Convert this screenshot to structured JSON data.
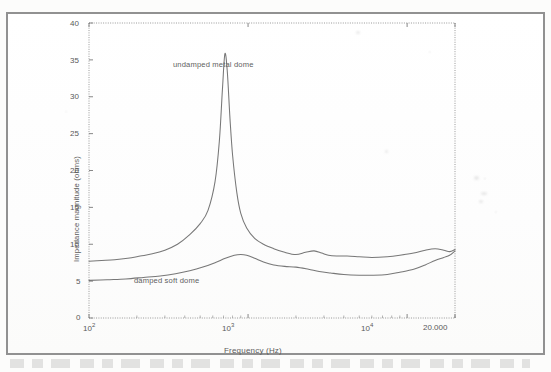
{
  "figure": {
    "background_color": "#ffffff",
    "frame_color": "#8e8e8e",
    "curve_color": "#6b6b6b",
    "axis_color": "#7a7a7a"
  },
  "axes": {
    "ylabel": "Impedance magnitude (ohms)",
    "xlabel": "Frequency (Hz)",
    "yticks": [
      "0",
      "5",
      "10",
      "15",
      "20",
      "25",
      "30",
      "35",
      "40"
    ],
    "xticks": [
      {
        "label": "10",
        "exp": "2"
      },
      {
        "label": "10",
        "exp": "3"
      },
      {
        "label": "10",
        "exp": "4"
      }
    ],
    "xend_label": "20.000"
  },
  "annotations": {
    "upper": "undamped metal dome",
    "lower": "damped soft dome"
  },
  "chart_data": {
    "type": "line",
    "title": "",
    "xlabel": "Frequency (Hz)",
    "ylabel": "Impedance magnitude (ohms)",
    "xscale": "log",
    "yscale": "linear",
    "xlim": [
      100,
      20000
    ],
    "ylim": [
      0,
      40
    ],
    "yticks": [
      0,
      5,
      10,
      15,
      20,
      25,
      30,
      35,
      40
    ],
    "xticks": [
      100,
      1000,
      10000,
      20000
    ],
    "xtick_labels": [
      "10^2",
      "10^3",
      "10^4",
      "20.000"
    ],
    "grid": false,
    "legend": "annotations-inline",
    "series": [
      {
        "name": "undamped metal dome",
        "annotation_x": 1700,
        "annotation_y": 33.5,
        "x": [
          100,
          120,
          145,
          175,
          210,
          250,
          300,
          360,
          430,
          500,
          560,
          620,
          660,
          690,
          715,
          740,
          770,
          800,
          850,
          900,
          980,
          1100,
          1250,
          1450,
          1700,
          2000,
          2300,
          2600,
          2900,
          3200,
          3600,
          4200,
          5000,
          6000,
          7500,
          9000,
          11000,
          13000,
          15000,
          17000,
          18500,
          20000
        ],
        "y": [
          7.7,
          7.8,
          7.9,
          8.1,
          8.4,
          8.7,
          9.2,
          10.0,
          11.3,
          12.8,
          14.6,
          18.5,
          24.0,
          31.0,
          35.8,
          33.5,
          27.0,
          22.0,
          17.0,
          14.2,
          12.2,
          10.8,
          10.0,
          9.4,
          8.9,
          8.6,
          8.9,
          9.1,
          8.8,
          8.5,
          8.4,
          8.4,
          8.3,
          8.2,
          8.3,
          8.5,
          8.8,
          9.2,
          9.4,
          9.2,
          9.0,
          9.3
        ]
      },
      {
        "name": "damped soft dome",
        "annotation_x": 800,
        "annotation_y": 5.1,
        "x": [
          100,
          130,
          170,
          220,
          280,
          350,
          430,
          520,
          620,
          720,
          820,
          900,
          980,
          1100,
          1250,
          1450,
          1700,
          2000,
          2400,
          2800,
          3300,
          4000,
          5000,
          6000,
          7500,
          9000,
          11000,
          13000,
          15000,
          17000,
          18500,
          20000
        ],
        "y": [
          5.1,
          5.2,
          5.3,
          5.5,
          5.7,
          6.0,
          6.4,
          6.9,
          7.5,
          8.1,
          8.5,
          8.6,
          8.5,
          8.1,
          7.6,
          7.2,
          7.0,
          6.9,
          6.6,
          6.3,
          6.1,
          5.9,
          5.8,
          5.8,
          5.9,
          6.2,
          6.6,
          7.2,
          7.8,
          8.2,
          8.5,
          9.1
        ]
      }
    ]
  }
}
